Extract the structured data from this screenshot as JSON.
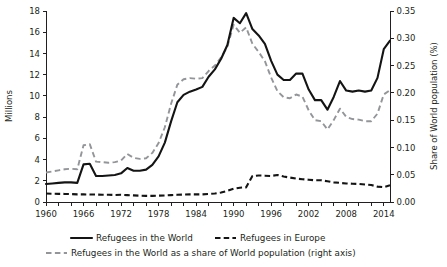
{
  "chart_data": {
    "type": "line",
    "title": "",
    "subtitle": "",
    "xlabel": "",
    "ylabel": "Millions",
    "y2label": "Share of World population (%)",
    "xlim": [
      1960,
      2015
    ],
    "ylim": [
      0,
      18
    ],
    "y2lim": [
      0.0,
      0.35
    ],
    "grid": false,
    "legend_position": "bottom",
    "x_ticks_major": [
      "1960",
      "1966",
      "1972",
      "1978",
      "1984",
      "1990",
      "1996",
      "2002",
      "2008",
      "2014"
    ],
    "x_tick_values_major": [
      1960,
      1966,
      1972,
      1978,
      1984,
      1990,
      1996,
      2002,
      2008,
      2014
    ],
    "x_tick_minor_step": 2,
    "y_ticks": [
      "0",
      "2",
      "4",
      "6",
      "8",
      "10",
      "12",
      "14",
      "16",
      "18"
    ],
    "y_tick_values": [
      0,
      2,
      4,
      6,
      8,
      10,
      12,
      14,
      16,
      18
    ],
    "y2_ticks": [
      "0.00",
      "0.05",
      "0.10",
      "0.15",
      "0.20",
      "0.25",
      "0.30",
      "0.35"
    ],
    "y2_tick_values": [
      0.0,
      0.05,
      0.1,
      0.15,
      0.2,
      0.25,
      0.3,
      0.35
    ],
    "x": [
      1960,
      1961,
      1962,
      1963,
      1964,
      1965,
      1966,
      1967,
      1968,
      1969,
      1970,
      1971,
      1972,
      1973,
      1974,
      1975,
      1976,
      1977,
      1978,
      1979,
      1980,
      1981,
      1982,
      1983,
      1984,
      1985,
      1986,
      1987,
      1988,
      1989,
      1990,
      1991,
      1992,
      1993,
      1994,
      1995,
      1996,
      1997,
      1998,
      1999,
      2000,
      2001,
      2002,
      2003,
      2004,
      2005,
      2006,
      2007,
      2008,
      2009,
      2010,
      2011,
      2012,
      2013,
      2014,
      2015
    ],
    "series": [
      {
        "name": "Refugees in the World",
        "axis": "left",
        "unit": "millions",
        "style": "solid",
        "color": "#141414",
        "values": [
          1.7,
          1.75,
          1.8,
          1.85,
          1.85,
          1.8,
          3.55,
          3.6,
          2.45,
          2.45,
          2.5,
          2.55,
          2.7,
          3.2,
          2.95,
          2.95,
          3.05,
          3.5,
          4.3,
          5.6,
          7.6,
          9.4,
          10.1,
          10.4,
          10.6,
          10.85,
          11.8,
          12.5,
          13.5,
          14.8,
          17.35,
          16.85,
          17.8,
          16.3,
          15.7,
          14.9,
          13.3,
          12.0,
          11.5,
          11.5,
          12.1,
          12.1,
          10.6,
          9.6,
          9.6,
          8.7,
          9.9,
          11.4,
          10.5,
          10.4,
          10.5,
          10.4,
          10.5,
          11.7,
          14.4,
          15.2
        ]
      },
      {
        "name": "Refugees in Europe",
        "axis": "left",
        "unit": "millions",
        "style": "dashed-black",
        "color": "#141414",
        "values": [
          0.8,
          0.78,
          0.77,
          0.76,
          0.75,
          0.72,
          0.72,
          0.7,
          0.7,
          0.68,
          0.68,
          0.66,
          0.68,
          0.65,
          0.62,
          0.6,
          0.58,
          0.58,
          0.6,
          0.62,
          0.65,
          0.68,
          0.7,
          0.72,
          0.72,
          0.72,
          0.75,
          0.8,
          0.9,
          1.05,
          1.25,
          1.35,
          1.38,
          2.45,
          2.5,
          2.48,
          2.45,
          2.55,
          2.4,
          2.3,
          2.2,
          2.15,
          2.1,
          2.05,
          2.05,
          1.95,
          1.85,
          1.8,
          1.75,
          1.72,
          1.7,
          1.65,
          1.6,
          1.45,
          1.4,
          1.58
        ]
      },
      {
        "name": "Refugees in the World as a share of World population (right axis)",
        "axis": "right",
        "unit": "percent",
        "style": "dashed-gray",
        "color": "#939598",
        "values": [
          0.054,
          0.056,
          0.058,
          0.06,
          0.061,
          0.06,
          0.104,
          0.106,
          0.074,
          0.073,
          0.072,
          0.073,
          0.076,
          0.088,
          0.081,
          0.079,
          0.08,
          0.09,
          0.108,
          0.137,
          0.18,
          0.215,
          0.225,
          0.227,
          0.226,
          0.227,
          0.24,
          0.25,
          0.265,
          0.285,
          0.325,
          0.31,
          0.32,
          0.29,
          0.275,
          0.258,
          0.228,
          0.203,
          0.192,
          0.19,
          0.197,
          0.193,
          0.168,
          0.15,
          0.148,
          0.133,
          0.15,
          0.171,
          0.156,
          0.152,
          0.151,
          0.148,
          0.148,
          0.162,
          0.197,
          0.205
        ]
      }
    ],
    "legend": [
      {
        "label": "Refugees in the World",
        "style": "solid",
        "color": "#141414"
      },
      {
        "label": "Refugees in Europe",
        "style": "dashed-black",
        "color": "#141414"
      },
      {
        "label": "Refugees in the World as a share of World population (right axis)",
        "style": "dashed-gray",
        "color": "#939598"
      }
    ]
  },
  "axes": {
    "left_title": "Millions",
    "right_title": "Share of World population (%)"
  }
}
